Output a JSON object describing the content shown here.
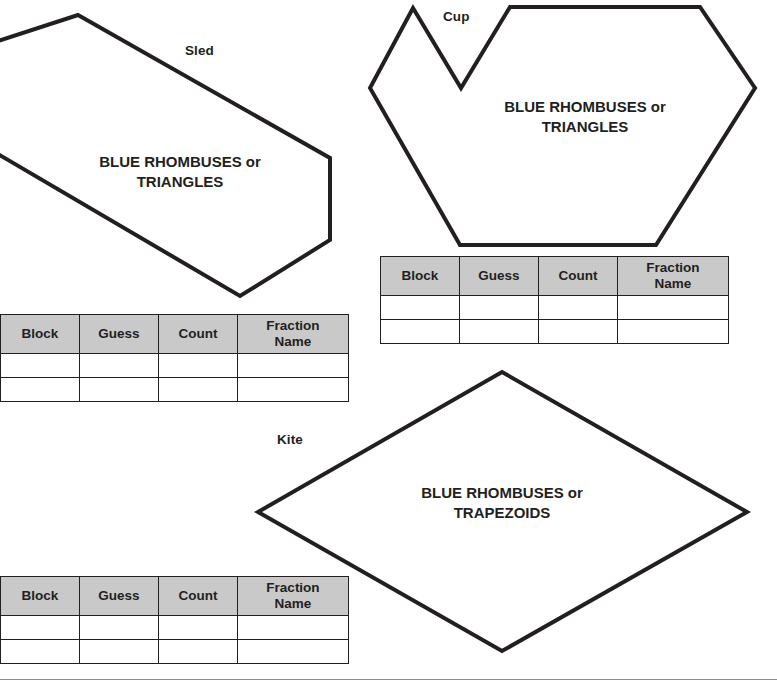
{
  "page": {
    "background_color": "#ffffff",
    "outline_color": "#231f20",
    "table_header_color": "#c9c9c9"
  },
  "shapes": [
    {
      "id": "sled",
      "name": "Sled",
      "fill_text_line1": "BLUE RHOMBUSES or",
      "fill_text_line2": "TRIANGLES",
      "polygon": "78,15 330,158 330,240 240,296 -60,120 -60,60"
    },
    {
      "id": "cup",
      "name": "Cup",
      "fill_text_line1": "BLUE RHOMBUSES or",
      "fill_text_line2": "TRIANGLES",
      "polygon": "413,8 461,88 510,7 700,7 755,88 656,245 460,245 370,88"
    },
    {
      "id": "kite",
      "name": "Kite",
      "fill_text_line1": "BLUE RHOMBUSES or",
      "fill_text_line2": "TRAPEZOIDS",
      "polygon": "502,372 747,512 502,651 258,512"
    }
  ],
  "table": {
    "columns": [
      "Block",
      "Guess",
      "Count",
      "Fraction Name"
    ],
    "column_labels": [
      {
        "text": "Block"
      },
      {
        "text": "Guess"
      },
      {
        "text": "Count"
      },
      {
        "text": "Fraction",
        "text2": "Name"
      }
    ],
    "rows": [
      [
        "",
        "",
        "",
        ""
      ],
      [
        "",
        "",
        "",
        ""
      ]
    ],
    "row_count": 2
  },
  "footer": {
    "text": ""
  }
}
